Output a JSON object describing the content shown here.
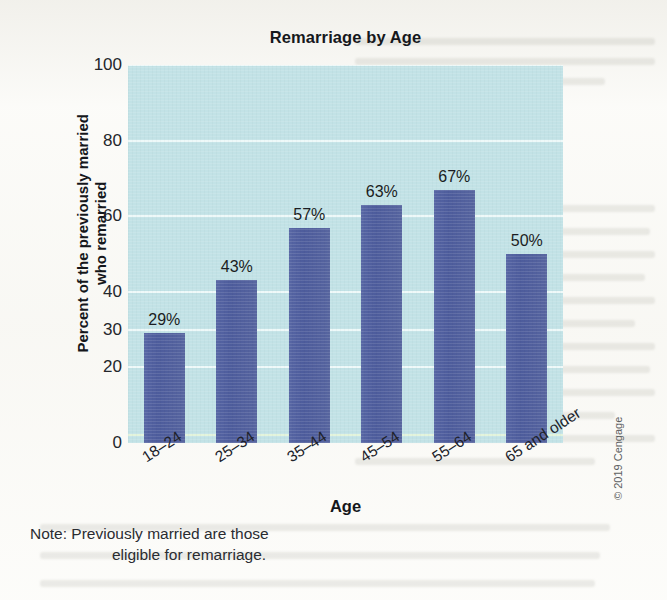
{
  "chart_data": {
    "type": "bar",
    "title": "Remarriage by Age",
    "xlabel": "Age",
    "ylabel": "Percent of the previously married\nwho remarried",
    "ylabel_line1": "Percent of the previously married",
    "ylabel_line2": "who remarried",
    "categories": [
      "18–24",
      "25–34",
      "35–44",
      "45–54",
      "55–64",
      "65 and older"
    ],
    "values": [
      29,
      43,
      57,
      63,
      67,
      50
    ],
    "data_labels": [
      "29%",
      "43%",
      "57%",
      "63%",
      "67%",
      "50%"
    ],
    "ylim": [
      0,
      100
    ],
    "ytick_labels": [
      "100",
      "80",
      "60",
      "40",
      "30",
      "20",
      "0"
    ],
    "ytick_values": [
      100,
      80,
      60,
      40,
      30,
      20,
      0
    ],
    "grid": true,
    "grid_axis": "y",
    "legend": "none",
    "bar_color": "#4f5ea0",
    "plot_background": "#c2e2e6",
    "gridline_color": "#f2fbfb"
  },
  "note": {
    "line1": "Note: Previously married are those",
    "line2": "eligible for remarriage."
  },
  "credit": {
    "text": "© 2019 Cengage"
  }
}
